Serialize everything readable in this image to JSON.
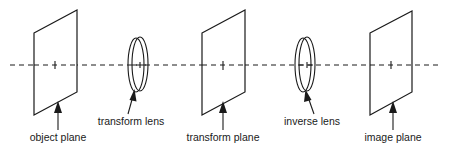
{
  "diagram": {
    "elements": [
      {
        "id": "object-plane",
        "type": "plane",
        "label": "object plane"
      },
      {
        "id": "transform-lens",
        "type": "lens",
        "label": "transform lens"
      },
      {
        "id": "transform-plane",
        "type": "plane",
        "label": "transform plane"
      },
      {
        "id": "inverse-lens",
        "type": "lens",
        "label": "inverse lens"
      },
      {
        "id": "image-plane",
        "type": "plane",
        "label": "image plane"
      }
    ],
    "optical_axis": "dashed line through centers of all elements",
    "colors": {
      "ink": "#1a1a1a",
      "background": "#ffffff"
    }
  }
}
